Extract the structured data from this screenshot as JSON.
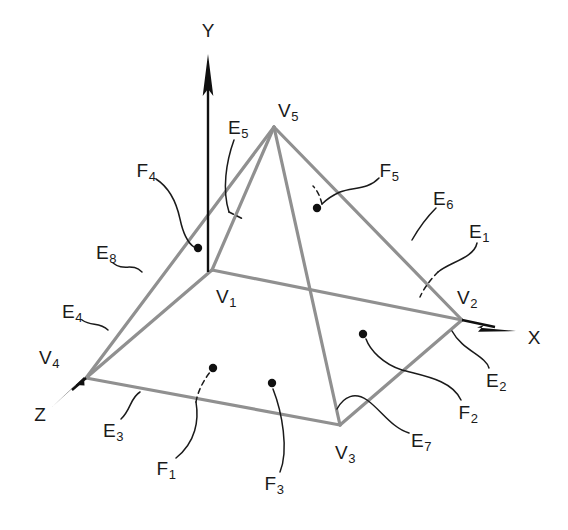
{
  "figure": {
    "kind": "solid-model-topology-diagram",
    "background_color": "#ffffff",
    "edge_color": "#909090",
    "axis_color": "#101010",
    "label_color": "#1a1a1a",
    "leader_color": "#1a1a1a"
  },
  "axes": [
    {
      "name": "y-axis",
      "label": "Y",
      "label_x": 208,
      "label_y": 30,
      "x1": 208,
      "y1": 272,
      "x2": 208,
      "y2": 55
    },
    {
      "name": "x-axis",
      "label": "X",
      "label_x": 534,
      "label_y": 337,
      "x1": 462,
      "y1": 320,
      "x2": 516,
      "y2": 331
    },
    {
      "name": "z-axis",
      "label": "Z",
      "label_x": 40,
      "label_y": 414,
      "x1": 86,
      "y1": 378,
      "x2": 52,
      "y2": 407
    }
  ],
  "vertices": [
    {
      "id": "V1",
      "label": "V",
      "sub": "1",
      "x": 212,
      "y": 270,
      "label_x": 226,
      "label_y": 296
    },
    {
      "id": "V2",
      "label": "V",
      "sub": "2",
      "x": 462,
      "y": 320,
      "label_x": 467,
      "label_y": 297
    },
    {
      "id": "V3",
      "label": "V",
      "sub": "3",
      "x": 340,
      "y": 425,
      "label_x": 345,
      "label_y": 452
    },
    {
      "id": "V4",
      "label": "V",
      "sub": "4",
      "x": 86,
      "y": 378,
      "label_x": 49,
      "label_y": 357
    },
    {
      "id": "V5",
      "label": "V",
      "sub": "5",
      "x": 274,
      "y": 127,
      "label_x": 288,
      "label_y": 110
    }
  ],
  "edges": [
    {
      "id": "E1",
      "label": "E",
      "sub": "1",
      "from": "V1",
      "to": "V2",
      "label_x": 479,
      "label_y": 231
    },
    {
      "id": "E2",
      "label": "E",
      "sub": "2",
      "from": "V2",
      "to": "V3",
      "label_x": 496,
      "label_y": 380
    },
    {
      "id": "E3",
      "label": "E",
      "sub": "3",
      "from": "V3",
      "to": "V4",
      "label_x": 113,
      "label_y": 430
    },
    {
      "id": "E4",
      "label": "E",
      "sub": "4",
      "from": "V4",
      "to": "V1",
      "label_x": 72,
      "label_y": 311
    },
    {
      "id": "E5",
      "label": "E",
      "sub": "5",
      "from": "V1",
      "to": "V5",
      "label_x": 238,
      "label_y": 127
    },
    {
      "id": "E6",
      "label": "E",
      "sub": "6",
      "from": "V2",
      "to": "V5",
      "label_x": 443,
      "label_y": 198
    },
    {
      "id": "E7",
      "label": "E",
      "sub": "7",
      "from": "V3",
      "to": "V5",
      "label_x": 421,
      "label_y": 440
    },
    {
      "id": "E8",
      "label": "E",
      "sub": "8",
      "from": "V4",
      "to": "V5",
      "label_x": 106,
      "label_y": 252
    }
  ],
  "faces": [
    {
      "id": "F1",
      "label": "F",
      "sub": "1",
      "label_x": 166,
      "label_y": 468,
      "dot_x": 213,
      "dot_y": 368
    },
    {
      "id": "F2",
      "label": "F",
      "sub": "2",
      "label_x": 468,
      "label_y": 412,
      "dot_x": 363,
      "dot_y": 334
    },
    {
      "id": "F3",
      "label": "F",
      "sub": "3",
      "label_x": 274,
      "label_y": 483,
      "dot_x": 272,
      "dot_y": 383
    },
    {
      "id": "F4",
      "label": "F",
      "sub": "4",
      "label_x": 146,
      "label_y": 170,
      "dot_x": 198,
      "dot_y": 248
    },
    {
      "id": "F5",
      "label": "F",
      "sub": "5",
      "label_x": 389,
      "label_y": 170,
      "dot_x": 317,
      "dot_y": 208
    }
  ]
}
